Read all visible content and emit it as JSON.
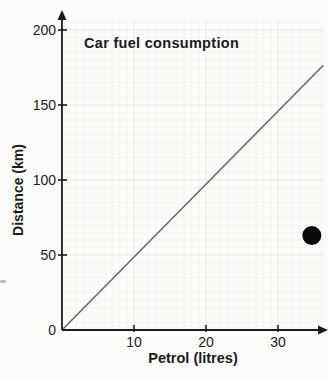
{
  "chart_data": {
    "type": "line",
    "title": "Car fuel consumption",
    "xlabel": "Petrol (litres)",
    "ylabel": "Distance (km)",
    "xlim": [
      0,
      36.5
    ],
    "ylim": [
      0,
      208
    ],
    "x_ticks": [
      10,
      20,
      30
    ],
    "y_ticks": [
      0,
      50,
      100,
      150,
      200
    ],
    "grid": true,
    "minor_grid_step": {
      "x": 1,
      "y": 5
    },
    "legend": "none",
    "series": [
      {
        "name": "consumption-line",
        "type": "line",
        "points": [
          [
            0,
            0
          ],
          [
            36.3,
            176.5
          ]
        ],
        "color": "#696969",
        "description": "straight line through origin, approx 4.9 km per litre"
      },
      {
        "name": "marked-point",
        "type": "scatter",
        "points": [
          [
            34.7,
            63
          ]
        ],
        "color": "#0a0a0a",
        "marker": "large-filled-circle",
        "marker_diameter_px": 19
      }
    ],
    "colors": {
      "axis": "#1a1a1a",
      "major_grid": "#e8e8e4",
      "minor_grid": "#f4f4f0",
      "tick_text": "#1a1a1a",
      "background": "#fcfcfa"
    }
  }
}
